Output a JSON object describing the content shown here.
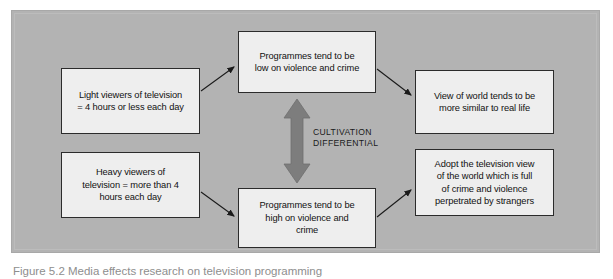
{
  "figure": {
    "panel_color": "#b3b3b3",
    "box_fill": "#eeeeee",
    "box_border": "#2b2b2b",
    "arrow_color": "#7d7d7d",
    "connector_color": "#1a1a1a",
    "center_label_line1": "CULTIVATION",
    "center_label_line2": "DIFFERENTIAL",
    "caption": "Figure 5.2  Media effects research on television programming"
  },
  "nodes": {
    "light_viewers": {
      "line1": "Light viewers of television",
      "line2": "= 4 hours or less each day"
    },
    "heavy_viewers": {
      "line1": "Heavy viewers of",
      "line2": "television = more than 4",
      "line3": "hours each day"
    },
    "low_violence": {
      "line1": "Programmes tend to be",
      "line2": "low on violence and crime"
    },
    "high_violence": {
      "line1": "Programmes tend to be",
      "line2": "high on violence and",
      "line3": "crime"
    },
    "realistic_view": {
      "line1": "View of world tends to be",
      "line2": "more similar to real life"
    },
    "tv_view": {
      "line1": "Adopt the television view",
      "line2": "of the world which is full",
      "line3": "of crime and violence",
      "line4": "perpetrated by strangers"
    }
  }
}
